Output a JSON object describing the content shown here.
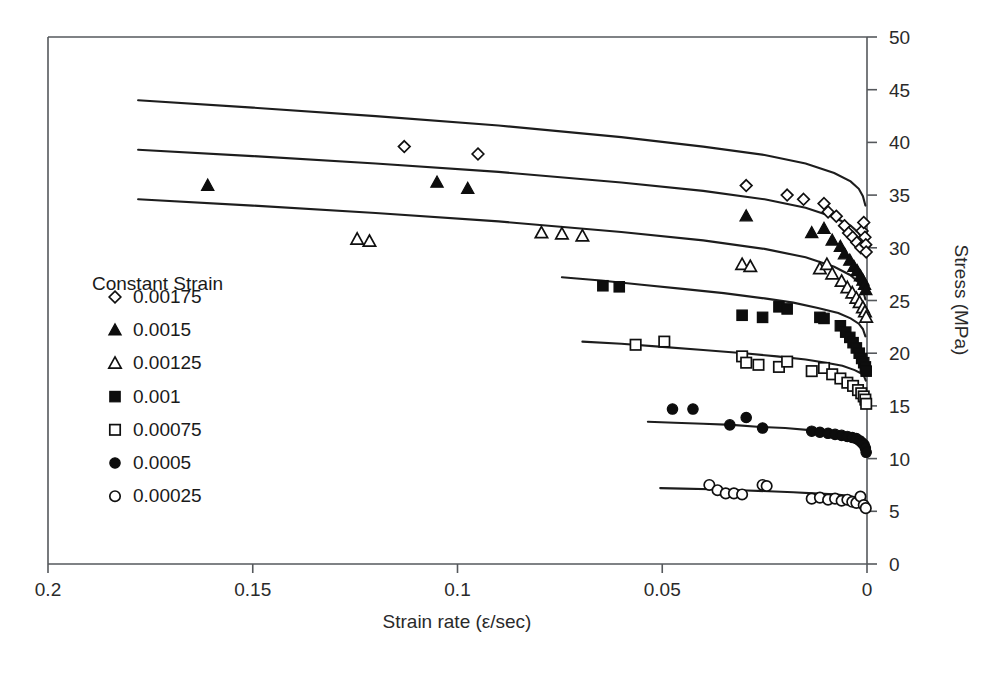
{
  "chart_data": {
    "type": "scatter",
    "title": "",
    "xlabel": "Strain rate (ε/sec)",
    "ylabel": "Stress (MPa)",
    "xlim": [
      0.2,
      0.0
    ],
    "ylim": [
      0,
      50
    ],
    "x_reversed": true,
    "xticks": [
      "0.2",
      "0.15",
      "0.1",
      "0.05",
      "0"
    ],
    "xtick_values": [
      0.2,
      0.15,
      0.1,
      0.05,
      0
    ],
    "yticks": [
      "0",
      "5",
      "10",
      "15",
      "20",
      "25",
      "30",
      "35",
      "40",
      "45",
      "50"
    ],
    "ytick_values": [
      0,
      5,
      10,
      15,
      20,
      25,
      30,
      35,
      40,
      45,
      50
    ],
    "y_axis_side": "right",
    "grid": false,
    "legend_position": "inside-left",
    "legend_title": "Constant Strain",
    "series": [
      {
        "name": "0.00175",
        "marker": "open-diamond",
        "fit_x": [
          0.178,
          0.15,
          0.12,
          0.09,
          0.06,
          0.04,
          0.025,
          0.015,
          0.008,
          0.004,
          0.002,
          0.001,
          0.0004
        ],
        "fit_y": [
          44.0,
          43.3,
          42.5,
          41.6,
          40.5,
          39.6,
          38.8,
          38.0,
          37.1,
          36.3,
          35.6,
          34.9,
          34.0
        ],
        "points": [
          [
            0.113,
            39.6
          ],
          [
            0.095,
            38.9
          ],
          [
            0.0295,
            35.9
          ],
          [
            0.0195,
            35.0
          ],
          [
            0.0155,
            34.6
          ],
          [
            0.0105,
            34.2
          ],
          [
            0.0095,
            33.4
          ],
          [
            0.0075,
            33.0
          ],
          [
            0.0055,
            32.1
          ],
          [
            0.0045,
            31.4
          ],
          [
            0.0035,
            31.0
          ],
          [
            0.0025,
            30.5
          ],
          [
            0.0015,
            30.0
          ],
          [
            0.0012,
            31.6
          ],
          [
            0.0008,
            32.4
          ],
          [
            0.0005,
            31.0
          ],
          [
            0.0003,
            30.3
          ],
          [
            0.0002,
            29.6
          ]
        ]
      },
      {
        "name": "0.0015",
        "marker": "filled-triangle",
        "fit_x": [
          0.178,
          0.15,
          0.12,
          0.09,
          0.06,
          0.04,
          0.025,
          0.015,
          0.008,
          0.004,
          0.002,
          0.001,
          0.0004
        ],
        "fit_y": [
          39.3,
          38.7,
          38.0,
          37.2,
          36.2,
          35.4,
          34.6,
          33.8,
          32.9,
          32.1,
          31.4,
          30.7,
          29.8
        ],
        "points": [
          [
            0.161,
            35.9
          ],
          [
            0.105,
            36.2
          ],
          [
            0.0975,
            35.6
          ],
          [
            0.0295,
            33.0
          ],
          [
            0.0135,
            31.4
          ],
          [
            0.0105,
            31.8
          ],
          [
            0.0085,
            30.7
          ],
          [
            0.0065,
            30.1
          ],
          [
            0.0055,
            29.4
          ],
          [
            0.0042,
            28.8
          ],
          [
            0.0032,
            28.2
          ],
          [
            0.0024,
            27.8
          ],
          [
            0.0016,
            27.3
          ],
          [
            0.001,
            26.9
          ],
          [
            0.0006,
            26.5
          ],
          [
            0.0003,
            26.0
          ]
        ]
      },
      {
        "name": "0.00125",
        "marker": "open-triangle",
        "fit_x": [
          0.178,
          0.15,
          0.12,
          0.09,
          0.06,
          0.04,
          0.025,
          0.015,
          0.008,
          0.004,
          0.002,
          0.001,
          0.0004
        ],
        "fit_y": [
          34.6,
          34.0,
          33.3,
          32.5,
          31.5,
          30.7,
          29.9,
          29.1,
          28.2,
          27.4,
          26.7,
          26.0,
          25.1
        ],
        "points": [
          [
            0.1245,
            30.8
          ],
          [
            0.1215,
            30.6
          ],
          [
            0.0795,
            31.4
          ],
          [
            0.0745,
            31.3
          ],
          [
            0.0695,
            31.1
          ],
          [
            0.0305,
            28.4
          ],
          [
            0.0285,
            28.2
          ],
          [
            0.0115,
            28.0
          ],
          [
            0.0098,
            28.4
          ],
          [
            0.0085,
            27.5
          ],
          [
            0.0062,
            26.8
          ],
          [
            0.0048,
            26.2
          ],
          [
            0.0036,
            25.7
          ],
          [
            0.0026,
            25.2
          ],
          [
            0.0018,
            24.8
          ],
          [
            0.001,
            24.3
          ],
          [
            0.0005,
            23.9
          ],
          [
            0.0002,
            23.4
          ]
        ]
      },
      {
        "name": "0.001",
        "marker": "filled-square",
        "fit_x": [
          0.0745,
          0.065,
          0.055,
          0.045,
          0.035,
          0.025,
          0.018,
          0.012,
          0.007,
          0.004,
          0.002,
          0.001,
          0.0004
        ],
        "fit_y": [
          27.2,
          26.9,
          26.5,
          26.1,
          25.7,
          25.2,
          24.8,
          24.3,
          23.8,
          23.3,
          22.8,
          22.3,
          21.6
        ],
        "points": [
          [
            0.0645,
            26.4
          ],
          [
            0.0605,
            26.3
          ],
          [
            0.0305,
            23.6
          ],
          [
            0.0255,
            23.4
          ],
          [
            0.0215,
            24.4
          ],
          [
            0.0195,
            24.2
          ],
          [
            0.0115,
            23.4
          ],
          [
            0.0105,
            23.3
          ],
          [
            0.0065,
            22.6
          ],
          [
            0.0052,
            22.0
          ],
          [
            0.0042,
            21.5
          ],
          [
            0.0034,
            21.0
          ],
          [
            0.0026,
            20.5
          ],
          [
            0.0019,
            20.0
          ],
          [
            0.0013,
            19.5
          ],
          [
            0.0008,
            19.1
          ],
          [
            0.0004,
            18.7
          ],
          [
            0.0002,
            18.3
          ]
        ]
      },
      {
        "name": "0.00075",
        "marker": "open-square",
        "fit_x": [
          0.0695,
          0.06,
          0.05,
          0.04,
          0.03,
          0.022,
          0.015,
          0.01,
          0.006,
          0.003,
          0.0015,
          0.0007,
          0.0003
        ],
        "fit_y": [
          21.1,
          20.9,
          20.6,
          20.3,
          20.0,
          19.7,
          19.4,
          19.1,
          18.8,
          18.4,
          18.1,
          17.8,
          17.4
        ],
        "points": [
          [
            0.0565,
            20.8
          ],
          [
            0.0495,
            21.1
          ],
          [
            0.0305,
            19.7
          ],
          [
            0.0295,
            19.1
          ],
          [
            0.0265,
            18.9
          ],
          [
            0.0215,
            18.7
          ],
          [
            0.0195,
            19.2
          ],
          [
            0.0135,
            18.3
          ],
          [
            0.0105,
            18.6
          ],
          [
            0.0085,
            18.0
          ],
          [
            0.0065,
            17.6
          ],
          [
            0.0048,
            17.2
          ],
          [
            0.0034,
            16.9
          ],
          [
            0.0022,
            16.5
          ],
          [
            0.0014,
            16.2
          ],
          [
            0.0008,
            15.9
          ],
          [
            0.0004,
            15.6
          ],
          [
            0.0002,
            15.2
          ]
        ]
      },
      {
        "name": "0.0005",
        "marker": "filled-circle",
        "fit_x": [
          0.0535,
          0.047,
          0.04,
          0.033,
          0.026,
          0.02,
          0.014,
          0.009,
          0.005,
          0.0025,
          0.0012,
          0.0005,
          0.0002
        ],
        "fit_y": [
          13.5,
          13.4,
          13.3,
          13.2,
          13.0,
          12.9,
          12.7,
          12.5,
          12.3,
          12.0,
          11.8,
          11.6,
          11.4
        ],
        "points": [
          [
            0.0475,
            14.7
          ],
          [
            0.0425,
            14.7
          ],
          [
            0.0295,
            13.9
          ],
          [
            0.0335,
            13.2
          ],
          [
            0.0255,
            12.9
          ],
          [
            0.0135,
            12.6
          ],
          [
            0.0115,
            12.5
          ],
          [
            0.0095,
            12.4
          ],
          [
            0.0078,
            12.3
          ],
          [
            0.0062,
            12.2
          ],
          [
            0.0048,
            12.1
          ],
          [
            0.0036,
            12.0
          ],
          [
            0.0026,
            11.9
          ],
          [
            0.0018,
            11.7
          ],
          [
            0.0012,
            11.5
          ],
          [
            0.0007,
            11.3
          ],
          [
            0.0004,
            11.0
          ],
          [
            0.0002,
            10.6
          ]
        ]
      },
      {
        "name": "0.00025",
        "marker": "open-circle",
        "fit_x": [
          0.0505,
          0.045,
          0.038,
          0.031,
          0.024,
          0.018,
          0.013,
          0.008,
          0.005,
          0.0025,
          0.0012,
          0.0005,
          0.0002
        ],
        "fit_y": [
          7.2,
          7.15,
          7.1,
          7.0,
          6.9,
          6.8,
          6.7,
          6.6,
          6.5,
          6.3,
          6.2,
          6.0,
          5.8
        ],
        "points": [
          [
            0.0385,
            7.5
          ],
          [
            0.0365,
            7.0
          ],
          [
            0.0345,
            6.7
          ],
          [
            0.0325,
            6.7
          ],
          [
            0.0305,
            6.6
          ],
          [
            0.0255,
            7.5
          ],
          [
            0.0245,
            7.4
          ],
          [
            0.0135,
            6.2
          ],
          [
            0.0115,
            6.3
          ],
          [
            0.0095,
            6.1
          ],
          [
            0.0078,
            6.2
          ],
          [
            0.0062,
            6.0
          ],
          [
            0.0048,
            6.1
          ],
          [
            0.0036,
            5.9
          ],
          [
            0.0026,
            5.8
          ],
          [
            0.0016,
            6.4
          ],
          [
            0.0008,
            5.6
          ],
          [
            0.0003,
            5.3
          ]
        ]
      }
    ]
  },
  "legend": {
    "title": "Constant Strain",
    "items": [
      {
        "label": "0.00175",
        "marker": "open-diamond"
      },
      {
        "label": "0.0015",
        "marker": "filled-triangle"
      },
      {
        "label": "0.00125",
        "marker": "open-triangle"
      },
      {
        "label": "0.001",
        "marker": "filled-square"
      },
      {
        "label": "0.00075",
        "marker": "open-square"
      },
      {
        "label": "0.0005",
        "marker": "filled-circle"
      },
      {
        "label": "0.00025",
        "marker": "open-circle"
      }
    ]
  },
  "axes": {
    "x_title": "Strain rate (ε/sec)",
    "y_title": "Stress (MPa)",
    "x_labels": [
      "0.2",
      "0.15",
      "0.1",
      "0.05",
      "0"
    ],
    "y_labels": [
      "50",
      "45",
      "40",
      "35",
      "30",
      "25",
      "20",
      "15",
      "10",
      "5",
      "0"
    ]
  },
  "colors": {
    "marker_stroke": "#101010",
    "marker_fill": "#0d0d0d",
    "line": "#1d1d1d",
    "axis": "#55585c",
    "background": "#ffffff"
  }
}
